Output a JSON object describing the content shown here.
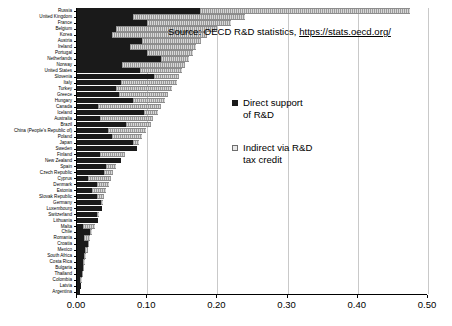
{
  "chart_data": {
    "type": "bar",
    "orientation": "horizontal",
    "stacked": true,
    "title": "",
    "xlabel": "",
    "ylabel": "",
    "xlim": [
      0.0,
      0.5
    ],
    "xticks": [
      "0.00",
      "0.10",
      "0.20",
      "0.30",
      "0.40",
      "0.50"
    ],
    "xtick_values": [
      0.0,
      0.1,
      0.2,
      0.3,
      0.4,
      0.5
    ],
    "grid": true,
    "grid_axis": "x",
    "legend_position": "center",
    "series": [
      {
        "name": "Direct support of R&D",
        "color": "#1a1a1a",
        "values": [
          0.004,
          0.006,
          0.004,
          0.007,
          0.008,
          0.009,
          0.01,
          0.012,
          0.016,
          0.01,
          0.019,
          0.008,
          0.03,
          0.029,
          0.035,
          0.034,
          0.029,
          0.022,
          0.028,
          0.016,
          0.038,
          0.041,
          0.062,
          0.033,
          0.085,
          0.08,
          0.05,
          0.044,
          0.07,
          0.033,
          0.095,
          0.03,
          0.08,
          0.06,
          0.055,
          0.062,
          0.11,
          0.09,
          0.064,
          0.12,
          0.1,
          0.075,
          0.092,
          0.05,
          0.055,
          0.1,
          0.08,
          0.175
        ]
      },
      {
        "name": "Indirect via R&D tax credit",
        "color": "#c0c0c0",
        "values": [
          0.0,
          0.0,
          0.003,
          0.002,
          0.002,
          0.002,
          0.003,
          0.003,
          0.001,
          0.009,
          0.003,
          0.017,
          0.0,
          0.003,
          0.0,
          0.003,
          0.01,
          0.02,
          0.017,
          0.032,
          0.014,
          0.014,
          0.0,
          0.035,
          0.0,
          0.008,
          0.043,
          0.055,
          0.035,
          0.075,
          0.02,
          0.09,
          0.045,
          0.07,
          0.08,
          0.08,
          0.035,
          0.06,
          0.09,
          0.04,
          0.065,
          0.095,
          0.085,
          0.135,
          0.145,
          0.12,
          0.16,
          0.3
        ]
      }
    ],
    "categories": [
      "Argentina",
      "Latvia",
      "Colombia",
      "Thailand",
      "Bulgaria",
      "Costa Rica",
      "South Africa",
      "Mexico",
      "Croatia",
      "Romania",
      "Chile",
      "Malta",
      "Lithuania",
      "Switzerland",
      "Luxembourg",
      "Germany",
      "Slovak Republic",
      "Estonia",
      "Denmark",
      "Cyprus",
      "Czech Republic",
      "Spain",
      "New Zealand",
      "Finland",
      "Sweden",
      "Japan",
      "Poland",
      "China (People's Republic of)",
      "Brazil",
      "Australia",
      "Iceland",
      "Canada",
      "Hungary",
      "Greece",
      "Turkey",
      "Italy",
      "Slovenia",
      "United States",
      "Norway",
      "Netherlands",
      "Portugal",
      "Ireland",
      "Austria",
      "Korea",
      "Belgium",
      "France",
      "United Kingdom",
      "Russia"
    ]
  },
  "source_note": {
    "prefix": "Source: OECD R&D statistics, ",
    "url": "https://stats.oecd.org/"
  },
  "legend": {
    "entries": [
      {
        "label": "Direct support\nof R&D"
      },
      {
        "label": "Indirect via R&D\ntax credit"
      }
    ]
  }
}
